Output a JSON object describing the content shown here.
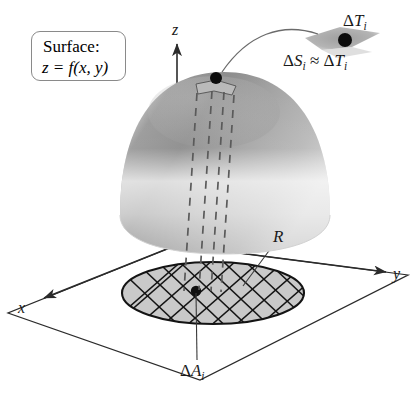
{
  "figure": {
    "name": "surface-area-double-integral-diagram",
    "width": 414,
    "height": 398,
    "background": "#ffffff"
  },
  "callout": {
    "title": "Surface:",
    "equation": "z = f(x, y)",
    "border_color": "#8a8a8a"
  },
  "axes": {
    "z_label": "z",
    "x_label": "x",
    "y_label": "y",
    "axis_color": "#2b2b2b",
    "origin": {
      "x": 177,
      "y": 245
    }
  },
  "region": {
    "label": "R",
    "fill": "#c9c9c9",
    "stroke": "#1a1a1a",
    "grid_stroke": "#1a1a1a",
    "center_point": {
      "x": 196,
      "y": 291
    }
  },
  "surface": {
    "name": "dome",
    "light_gray": "#f2f2f2",
    "mid_gray": "#b4b4b4",
    "dark_gray": "#8f8f8f",
    "apex_point": {
      "x": 216,
      "y": 78
    }
  },
  "annotations": {
    "delta_T": {
      "delta": "Δ",
      "symbol": "T",
      "subscript": "i"
    },
    "delta_S_approx_T": {
      "delta1": "Δ",
      "symbol1": "S",
      "subscript1": "i",
      "relation": "≈",
      "delta2": "Δ",
      "symbol2": "T",
      "subscript2": "i"
    },
    "delta_A": {
      "delta": "Δ",
      "symbol": "A",
      "subscript": "i"
    },
    "tangent_patch_fill": "#a8a8a8",
    "dashed_projection_color": "#5a5a5a",
    "leader_color": "#6b6b6b"
  }
}
